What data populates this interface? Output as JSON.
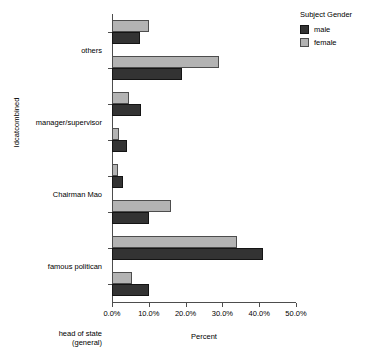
{
  "chart_data": {
    "type": "bar",
    "orientation": "horizontal",
    "title": "",
    "xlabel": "Percent",
    "ylabel": "Idcatcombined",
    "xlim": [
      0,
      50
    ],
    "xticks": [
      "0.0%",
      "10.0%",
      "20.0%",
      "30.0%",
      "40.0%",
      "50.0%"
    ],
    "xtick_values": [
      0,
      10,
      20,
      30,
      40,
      50
    ],
    "grid": false,
    "legend": {
      "title": "Subject Gender",
      "position": "right",
      "entries": [
        {
          "name": "male",
          "color": "#333333"
        },
        {
          "name": "female",
          "color": "#b3b3b3"
        }
      ]
    },
    "categories": [
      "others",
      "manager/supervisor",
      "Chairman Mao",
      "famous politican",
      "head of state\n(general)",
      "teacher",
      "person",
      "military personnel"
    ],
    "series": [
      {
        "name": "female",
        "color": "#b3b3b3",
        "values": [
          10.0,
          29.0,
          4.5,
          2.0,
          1.5,
          16.0,
          34.0,
          5.5
        ]
      },
      {
        "name": "male",
        "color": "#333333",
        "values": [
          7.5,
          19.0,
          8.0,
          4.0,
          3.0,
          10.0,
          41.0,
          10.0
        ]
      }
    ]
  }
}
